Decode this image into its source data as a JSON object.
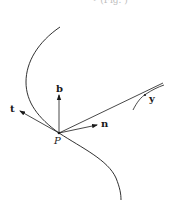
{
  "figure": {
    "cropped_top_text": "• (Fig. )",
    "labels": {
      "tangent": "t",
      "binormal": "b",
      "normal": "n",
      "point": "P",
      "other_point": "y"
    },
    "colors": {
      "ink": "#1a1a1a",
      "background": "#ffffff"
    }
  }
}
